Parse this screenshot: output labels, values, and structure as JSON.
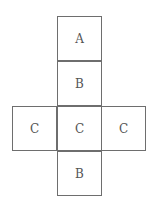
{
  "diagram": {
    "type": "cube-net",
    "faces": [
      {
        "label": "A",
        "row": 0,
        "col": 1
      },
      {
        "label": "B",
        "row": 1,
        "col": 1
      },
      {
        "label": "C",
        "row": 2,
        "col": 0
      },
      {
        "label": "C",
        "row": 2,
        "col": 1
      },
      {
        "label": "C",
        "row": 2,
        "col": 2
      },
      {
        "label": "B",
        "row": 3,
        "col": 1
      }
    ]
  }
}
